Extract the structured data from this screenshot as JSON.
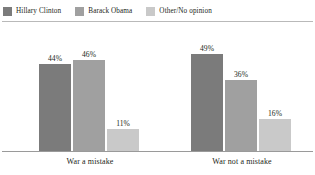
{
  "chart_data": {
    "type": "bar",
    "title": "",
    "subtitle": "",
    "xlabel": "",
    "ylabel": "",
    "ylim": [
      0,
      60
    ],
    "grid": false,
    "legend_position": "top-left",
    "value_suffix": "%",
    "categories": [
      "War a mistake",
      "War not a mistake"
    ],
    "series": [
      {
        "name": "Hillary Clinton",
        "color": "#7b7b7b",
        "values": [
          44,
          49
        ]
      },
      {
        "name": "Barack Obama",
        "color": "#a0a0a0",
        "values": [
          46,
          36
        ]
      },
      {
        "name": "Other/No opinion",
        "color": "#c9c9c9",
        "values": [
          11,
          16
        ]
      }
    ],
    "labels": {
      "group0": [
        "44%",
        "46%",
        "11%"
      ],
      "group1": [
        "49%",
        "36%",
        "16%"
      ]
    }
  },
  "legend": {
    "items": [
      {
        "label": "Hillary Clinton",
        "color": "#7b7b7b"
      },
      {
        "label": "Barack Obama",
        "color": "#a0a0a0"
      },
      {
        "label": "Other/No opinion",
        "color": "#c9c9c9"
      }
    ]
  },
  "axis": {
    "categories": [
      {
        "label": "War a mistake"
      },
      {
        "label": "War not a mistake"
      }
    ]
  },
  "colors": {
    "background": "#ffffff",
    "text": "#231f20",
    "rule": "#b9b9b9",
    "baseline": "#9a9a9a"
  }
}
